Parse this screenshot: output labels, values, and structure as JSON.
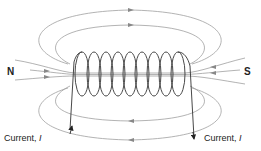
{
  "diagram": {
    "title": "",
    "labels": {
      "north": "N",
      "south": "S",
      "current_left": "Current, ",
      "current_right": "Current, ",
      "current_symbol": "I"
    },
    "coil_turns": 9,
    "colors": {
      "field_line": "#9a9a9a",
      "coil": "#333333",
      "text": "#222222"
    }
  }
}
